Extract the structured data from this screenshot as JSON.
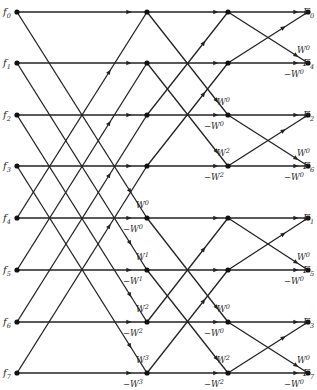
{
  "diagram": {
    "type": "fft-butterfly-decimation-in-frequency",
    "inputs": [
      {
        "name": "f",
        "sub": "0"
      },
      {
        "name": "f",
        "sub": "1"
      },
      {
        "name": "f",
        "sub": "2"
      },
      {
        "name": "f",
        "sub": "3"
      },
      {
        "name": "f",
        "sub": "4"
      },
      {
        "name": "f",
        "sub": "5"
      },
      {
        "name": "f",
        "sub": "6"
      },
      {
        "name": "f",
        "sub": "7"
      }
    ],
    "outputs": [
      {
        "name": "F",
        "sub": "0"
      },
      {
        "name": "F",
        "sub": "4"
      },
      {
        "name": "F",
        "sub": "2"
      },
      {
        "name": "F",
        "sub": "6"
      },
      {
        "name": "F",
        "sub": "1"
      },
      {
        "name": "F",
        "sub": "5"
      },
      {
        "name": "F",
        "sub": "3"
      },
      {
        "name": "F",
        "sub": "7"
      }
    ],
    "stage1_weights": [
      {
        "label": "W",
        "exp": "0",
        "row": 4,
        "kind": "diag"
      },
      {
        "label": "−W",
        "exp": "0",
        "row": 4,
        "kind": "horiz"
      },
      {
        "label": "W",
        "exp": "1",
        "row": 5,
        "kind": "diag"
      },
      {
        "label": "−W",
        "exp": "1",
        "row": 5,
        "kind": "horiz"
      },
      {
        "label": "W",
        "exp": "2",
        "row": 6,
        "kind": "diag"
      },
      {
        "label": "−W",
        "exp": "2",
        "row": 6,
        "kind": "horiz"
      },
      {
        "label": "W",
        "exp": "3",
        "row": 7,
        "kind": "diag"
      },
      {
        "label": "−W",
        "exp": "3",
        "row": 7,
        "kind": "horiz"
      }
    ],
    "stage2_weights": [
      {
        "label": "W",
        "exp": "0",
        "row": 2,
        "kind": "diag"
      },
      {
        "label": "−W",
        "exp": "0",
        "row": 2,
        "kind": "horiz"
      },
      {
        "label": "W",
        "exp": "2",
        "row": 3,
        "kind": "diag"
      },
      {
        "label": "−W",
        "exp": "2",
        "row": 3,
        "kind": "horiz"
      },
      {
        "label": "W",
        "exp": "0",
        "row": 6,
        "kind": "diag"
      },
      {
        "label": "−W",
        "exp": "0",
        "row": 6,
        "kind": "horiz"
      },
      {
        "label": "W",
        "exp": "2",
        "row": 7,
        "kind": "diag"
      },
      {
        "label": "−W",
        "exp": "2",
        "row": 7,
        "kind": "horiz"
      }
    ],
    "stage3_weights": [
      {
        "label": "W",
        "exp": "0",
        "row": 1,
        "kind": "diag"
      },
      {
        "label": "−W",
        "exp": "0",
        "row": 1,
        "kind": "horiz"
      },
      {
        "label": "W",
        "exp": "0",
        "row": 3,
        "kind": "diag"
      },
      {
        "label": "−W",
        "exp": "0",
        "row": 3,
        "kind": "horiz"
      },
      {
        "label": "W",
        "exp": "0",
        "row": 5,
        "kind": "diag"
      },
      {
        "label": "−W",
        "exp": "0",
        "row": 5,
        "kind": "horiz"
      },
      {
        "label": "W",
        "exp": "0",
        "row": 7,
        "kind": "diag"
      },
      {
        "label": "−W",
        "exp": "0",
        "row": 7,
        "kind": "horiz"
      }
    ],
    "layout": {
      "columns_x": [
        17,
        147,
        228,
        308
      ],
      "rows_y": [
        12,
        63,
        115,
        166,
        218,
        270,
        322,
        373
      ],
      "stage_spans": [
        4,
        2,
        1
      ]
    }
  }
}
